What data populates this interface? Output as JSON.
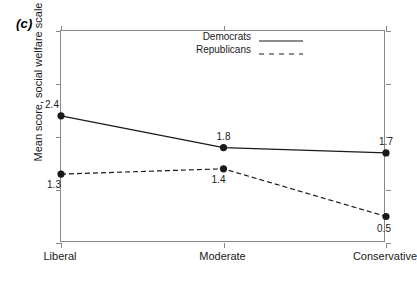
{
  "panel": {
    "label": "(c)"
  },
  "chart_data": {
    "type": "line",
    "title": "",
    "xlabel": "",
    "ylabel": "Mean score, social welfare scale",
    "categories": [
      "Liberal",
      "Moderate",
      "Conservative"
    ],
    "ylim": [
      0,
      4
    ],
    "yticks": [
      "0",
      "1",
      "2",
      "3",
      "4"
    ],
    "ytick_values": [
      0,
      1,
      2,
      3,
      4
    ],
    "grid": false,
    "legend_position": "top-left-inside",
    "series": [
      {
        "name": "Democrats",
        "values": [
          2.4,
          1.8,
          1.7
        ],
        "labels": [
          "2.4",
          "1.8",
          "1.7"
        ],
        "style": "solid",
        "color": "#1a1a1a",
        "marker": "filled-circle"
      },
      {
        "name": "Republicans",
        "values": [
          1.3,
          1.4,
          0.5
        ],
        "labels": [
          "1.3",
          "1.4",
          "0.5"
        ],
        "style": "dashed",
        "color": "#1a1a1a",
        "marker": "filled-circle"
      }
    ]
  },
  "legend": {
    "items": [
      {
        "label": "Democrats",
        "style": "solid"
      },
      {
        "label": "Republicans",
        "style": "dashed"
      }
    ]
  },
  "colors": {
    "line": "#1a1a1a",
    "axis": "#888888",
    "text": "#1a1a1a",
    "background": "#ffffff"
  }
}
